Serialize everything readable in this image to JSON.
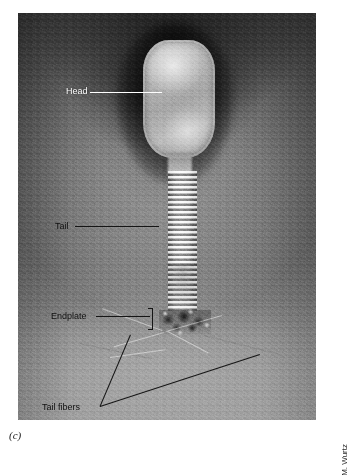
{
  "figure": {
    "panel_letter": "(c)",
    "credit": "M. Wurtz",
    "background_color": "#ffffff"
  },
  "micrograph": {
    "name": "transmission-electron-micrograph",
    "plate_bounds": {
      "x": 18,
      "y": 13,
      "width": 298,
      "height": 407
    },
    "tone": {
      "top": "#4a4a4a",
      "middle": "#8f8f8f",
      "bottom": "#e2e2e2"
    }
  },
  "structures": [
    {
      "id": "head",
      "name": "phage-head-capsid",
      "fill": "#b4b4b4"
    },
    {
      "id": "neck",
      "name": "phage-neck",
      "fill": "#c8c8c8"
    },
    {
      "id": "tail",
      "name": "phage-tail-sheath",
      "fill": "#f0f0f0"
    },
    {
      "id": "endplate",
      "name": "phage-endplate",
      "fill": "#202020"
    },
    {
      "id": "fibers",
      "name": "phage-tail-fibers",
      "fill": "#ffffff"
    }
  ],
  "annotations": [
    {
      "id": "head",
      "label": "Head",
      "label_color": "#ffffff",
      "leader_color": "#ffffff",
      "label_pos": {
        "x": 66,
        "y": 79
      },
      "leader": {
        "x": 90,
        "y": 84,
        "length": 72,
        "angle": 0
      }
    },
    {
      "id": "tail",
      "label": "Tail",
      "label_color": "#111111",
      "leader_color": "#151515",
      "label_pos": {
        "x": 55,
        "y": 214
      },
      "leader": {
        "x": 75,
        "y": 218,
        "length": 81,
        "angle": 0
      }
    },
    {
      "id": "endplate",
      "label": "Endplate",
      "label_color": "#111111",
      "leader_color": "#151515",
      "label_pos": {
        "x": 51,
        "y": 304
      },
      "leader": {
        "x": 96,
        "y": 308,
        "length": 54,
        "angle": 0
      },
      "bracket": {
        "x": 150,
        "y": 300,
        "width": 4,
        "height": 20
      }
    },
    {
      "id": "tail-fibers",
      "label": "Tail fibers",
      "label_color": "#111111",
      "leader_color": "#151515",
      "label_pos": {
        "x": 42,
        "y": 395
      },
      "leaders": [
        {
          "x": 100,
          "y": 398,
          "length": 78,
          "angle": -67
        },
        {
          "x": 100,
          "y": 398,
          "length": 168,
          "angle": -18
        }
      ]
    }
  ]
}
